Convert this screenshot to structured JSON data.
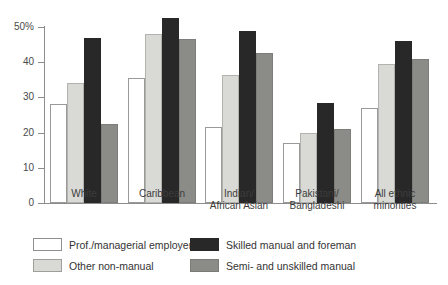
{
  "chart_data": {
    "type": "bar",
    "title": "",
    "xlabel": "",
    "ylabel": "",
    "ylim": [
      0,
      50
    ],
    "grid": false,
    "legend_position": "bottom",
    "categories": [
      "White",
      "Caribbean",
      "Indian/\nAfrican Asian",
      "Pakistani/\nBangladeshi",
      "All ethnic\nminorities"
    ],
    "category_lines": [
      [
        "White"
      ],
      [
        "Caribbean"
      ],
      [
        "Indian/",
        "African Asian"
      ],
      [
        "Pakistani/",
        "Bangladeshi"
      ],
      [
        "All ethnic",
        "minorities"
      ]
    ],
    "yticks": [
      0,
      10,
      20,
      30,
      40,
      50
    ],
    "ytick_labels": [
      "0",
      "10",
      "20",
      "30",
      "40",
      "50%"
    ],
    "series": [
      {
        "name": "Prof./managerial employers",
        "color": "#ffffff",
        "values": [
          28,
          35.5,
          21.5,
          17,
          27
        ]
      },
      {
        "name": "Other non-manual",
        "color": "#d9d9d5",
        "values": [
          34,
          48,
          36.5,
          20,
          39.5
        ]
      },
      {
        "name": "Skilled manual and foreman",
        "color": "#282828",
        "values": [
          47,
          52.5,
          49,
          28.5,
          46
        ]
      },
      {
        "name": "Semi- and unskilled manual",
        "color": "#8b8b88",
        "values": [
          22.5,
          46.5,
          42.5,
          21,
          41
        ]
      }
    ]
  },
  "legend": {
    "items": [
      {
        "label": "Prof./managerial employers",
        "swatch": "white-swatch"
      },
      {
        "label": "Other non-manual",
        "swatch": "light-gray-swatch"
      },
      {
        "label": "Skilled manual and foreman",
        "swatch": "black-swatch"
      },
      {
        "label": "Semi- and unskilled manual",
        "swatch": "medium-gray-swatch"
      }
    ]
  }
}
